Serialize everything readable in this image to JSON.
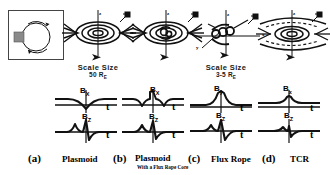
{
  "figure": {
    "panel_count": 4,
    "colors": {
      "ink": "#000000",
      "frame": "#444444",
      "background": "#ffffff",
      "inset_fill": "#8a8a8a"
    }
  },
  "scale_labels": [
    {
      "id": "scale-left",
      "line1": "Scale  Size",
      "line2_value": "50",
      "line2_unit": "R",
      "line2_sub": "E"
    },
    {
      "id": "scale-right",
      "line1": "Scale  Size",
      "line2_value": "3-5",
      "line2_unit": "R",
      "line2_sub": "E"
    }
  ],
  "axes": {
    "z": "z",
    "x": "x",
    "y": "y",
    "t": "t"
  },
  "panels": [
    {
      "id": "a",
      "label": "(a)",
      "name": "Plasmoid",
      "subname": "",
      "topology": "closed-loop-plasmoid",
      "has_frame_inset": true,
      "signals": [
        {
          "component": "B",
          "sub": "X",
          "shape": "dip",
          "axis_label": "t"
        },
        {
          "component": "B",
          "sub": "Z",
          "shape": "bipolar-plus-minus",
          "axis_label": "t"
        }
      ]
    },
    {
      "id": "b",
      "label": "(b)",
      "name": "Plasmoid",
      "subname": "With a Flux Rope Core",
      "topology": "plasmoid-with-core",
      "has_frame_inset": false,
      "signals": [
        {
          "component": "B",
          "sub": "X",
          "shape": "dip-with-central-spike",
          "axis_label": "t"
        },
        {
          "component": "B",
          "sub": "Z",
          "shape": "bipolar-plus-minus",
          "axis_label": "t"
        }
      ]
    },
    {
      "id": "c",
      "label": "(c)",
      "name": "Flux Rope",
      "subname": "",
      "topology": "helical-flux-rope",
      "has_frame_inset": false,
      "signals": [
        {
          "component": "B",
          "sub": "y",
          "shape": "peak",
          "axis_label": "t"
        },
        {
          "component": "B",
          "sub": "Z",
          "shape": "bipolar-plus-minus",
          "axis_label": "t"
        }
      ]
    },
    {
      "id": "d",
      "label": "(d)",
      "name": "TCR",
      "subname": "",
      "topology": "traveling-compression-region",
      "has_frame_inset": false,
      "signals": [
        {
          "component": "B",
          "sub": "x",
          "shape": "small-bump",
          "axis_label": "t"
        },
        {
          "component": "B",
          "sub": "Z",
          "shape": "small-bipolar",
          "axis_label": "t"
        }
      ]
    }
  ]
}
